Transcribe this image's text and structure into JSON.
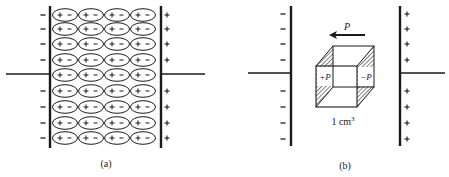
{
  "panel_a": {
    "caption": "(a)",
    "left_plate_charges": [
      "−",
      "−",
      "−",
      "−",
      "−",
      "−",
      "−",
      "−"
    ],
    "right_plate_charges": [
      "+",
      "+",
      "+",
      "+",
      "+",
      "+",
      "+",
      "+"
    ],
    "dipole_rows": 9,
    "dipole_cols": 4,
    "dipole_label": "+ −"
  },
  "panel_b": {
    "caption": "(b)",
    "arrow_label": "P",
    "left_face_label": "+P",
    "right_face_label": "−P",
    "volume_label": "1 cm",
    "volume_exponent": "3",
    "left_plate_charges": [
      "−",
      "−",
      "−",
      "−",
      "−",
      "−",
      "−",
      "−"
    ],
    "right_plate_charges": [
      "+",
      "+",
      "+",
      "+",
      "+",
      "+",
      "+",
      "+"
    ]
  },
  "colors": {
    "ink": "#1a1a1a",
    "background": "#ffffff"
  }
}
